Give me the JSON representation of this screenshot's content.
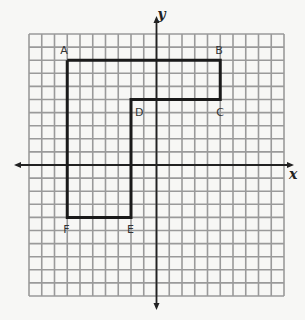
{
  "diagram": {
    "type": "coordinate-grid",
    "x_axis_label": "x",
    "y_axis_label": "y",
    "x_range": [
      -10,
      10
    ],
    "y_range": [
      -10,
      10
    ],
    "grid_step": 1,
    "polygon": {
      "vertices": [
        {
          "label": "A",
          "x": -7,
          "y": 8
        },
        {
          "label": "B",
          "x": 5,
          "y": 8
        },
        {
          "label": "C",
          "x": 5,
          "y": 5
        },
        {
          "label": "D",
          "x": -2,
          "y": 5
        },
        {
          "label": "E",
          "x": -2,
          "y": -4
        },
        {
          "label": "F",
          "x": -7,
          "y": -4
        }
      ],
      "closed": true
    },
    "colors": {
      "grid": "#9a9a9a",
      "axis": "#222222",
      "shape": "#1a1a1a",
      "background": "#f7f7f5"
    }
  }
}
